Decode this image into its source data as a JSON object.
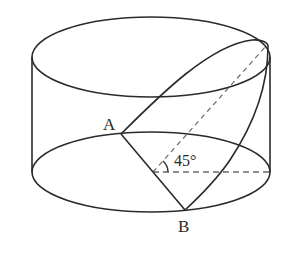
{
  "diagram": {
    "type": "cylinder-cross-section",
    "labels": {
      "point_a": "A",
      "point_b": "B",
      "angle": "45°"
    },
    "colors": {
      "stroke": "#2a2a2a",
      "dashed": "#6a6a6a",
      "background": "#ffffff"
    }
  }
}
